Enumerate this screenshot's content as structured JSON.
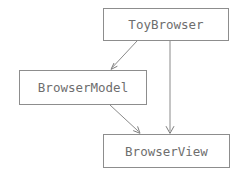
{
  "diagram": {
    "width": 246,
    "height": 176,
    "background_color": "#ffffff",
    "box_border_color": "#8d8d8d",
    "box_fill_color": "#ffffff",
    "text_color": "#6e6e6e",
    "edge_color": "#8a8a8a",
    "nodes": [
      {
        "id": "toybrowser",
        "label": "ToyBrowser",
        "x": 103,
        "y": 8,
        "width": 126,
        "height": 33
      },
      {
        "id": "browsermodel",
        "label": "BrowserModel",
        "x": 19,
        "y": 70,
        "width": 128,
        "height": 35
      },
      {
        "id": "browserview",
        "label": "BrowserView",
        "x": 103,
        "y": 134,
        "width": 127,
        "height": 34
      }
    ],
    "edges": [
      {
        "id": "edge-toybrowser-browsermodel",
        "from": "toybrowser",
        "to": "browsermodel",
        "style": "diagonal",
        "arrowhead": "open-v",
        "x1": 137,
        "y1": 41,
        "x2": 111,
        "y2": 69
      },
      {
        "id": "edge-toybrowser-browserview",
        "from": "toybrowser",
        "to": "browserview",
        "style": "vertical",
        "arrowhead": "open-v",
        "x1": 170,
        "y1": 41,
        "x2": 170,
        "y2": 133
      },
      {
        "id": "edge-browsermodel-browserview",
        "from": "browsermodel",
        "to": "browserview",
        "style": "diagonal",
        "arrowhead": "open-v",
        "x1": 110,
        "y1": 105,
        "x2": 140,
        "y2": 133
      }
    ]
  }
}
